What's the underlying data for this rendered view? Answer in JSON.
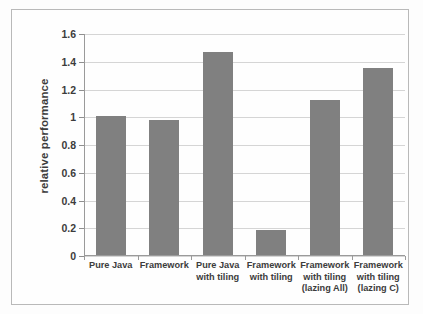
{
  "chart_data": {
    "type": "bar",
    "title": "",
    "subtitle": "",
    "xlabel": "",
    "ylabel": "relative performance",
    "categories": [
      "Pure Java",
      "Framework",
      "Pure Java with tiling",
      "Framework with tiling",
      "Framework with tiling (lazing All)",
      "Framework with tiling (lazing C)"
    ],
    "category_lines": [
      [
        "Pure Java"
      ],
      [
        "Framework"
      ],
      [
        "Pure Java",
        "with tiling"
      ],
      [
        "Framework",
        "with tiling"
      ],
      [
        "Framework",
        "with tiling",
        "(lazing All)"
      ],
      [
        "Framework",
        "with tiling",
        "(lazing C)"
      ]
    ],
    "values": [
      1.0,
      0.97,
      1.46,
      0.18,
      1.12,
      1.35
    ],
    "ylim": [
      0,
      1.6
    ],
    "ytick_values": [
      0,
      0.2,
      0.4,
      0.6,
      0.8,
      1.0,
      1.2,
      1.4,
      1.6
    ],
    "ytick_labels": [
      "0",
      "0.2",
      "0.4",
      "0.6",
      "0.8",
      "1",
      "1.2",
      "1.4",
      "1.6"
    ],
    "grid": true,
    "grid_axis": "y",
    "legend": false,
    "legend_position": "none",
    "bar_color": "#808080",
    "gridline_color": "#d5d5d5",
    "axis_color": "#9a9a9a",
    "text_color": "#3c3c3c",
    "background_color": "#fefefe"
  }
}
